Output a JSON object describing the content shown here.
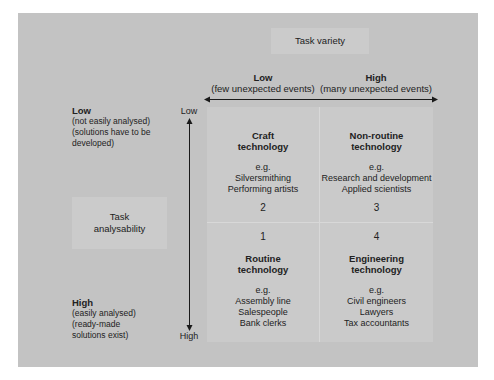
{
  "diagram": {
    "horizontal_axis": {
      "title": "Task variety",
      "low": {
        "label": "Low",
        "sub": "(few unexpected events)"
      },
      "high": {
        "label": "High",
        "sub": "(many unexpected events)"
      }
    },
    "vertical_axis": {
      "title_line1": "Task",
      "title_line2": "analysability",
      "top_end": "Low",
      "bottom_end": "High",
      "low": {
        "label": "Low",
        "lines": [
          "(not easily analysed)",
          "(solutions have to be",
          "developed)"
        ]
      },
      "high": {
        "label": "High",
        "lines": [
          "(easily analysed)",
          "(ready-made",
          "solutions exist)"
        ]
      }
    },
    "quadrants": [
      {
        "number": "2",
        "name_line1": "Craft",
        "name_line2": "technology",
        "eg": "e.g.",
        "examples": [
          "Silversmithing",
          "Performing artists"
        ]
      },
      {
        "number": "3",
        "name_line1": "Non-routine",
        "name_line2": "technology",
        "eg": "e.g.",
        "examples": [
          "Research and development",
          "Applied scientists"
        ]
      },
      {
        "number": "1",
        "name_line1": "Routine",
        "name_line2": "technology",
        "eg": "e.g.",
        "examples": [
          "Assembly line",
          "Salespeople",
          "Bank clerks"
        ]
      },
      {
        "number": "4",
        "name_line1": "Engineering",
        "name_line2": "technology",
        "eg": "e.g.",
        "examples": [
          "Civil engineers",
          "Lawyers",
          "Tax accountants"
        ]
      }
    ]
  },
  "colors": {
    "panel_background": "#c3c3c3",
    "box_background": "#cbcbcb",
    "text": "#222222",
    "arrow": "#1a1a1a"
  }
}
